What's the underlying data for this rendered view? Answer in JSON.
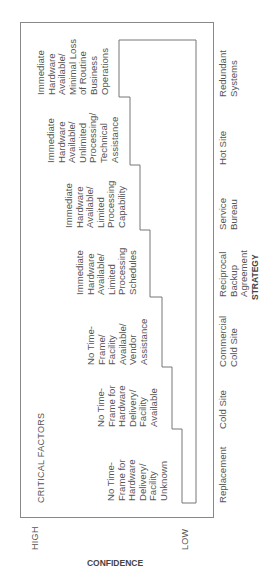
{
  "diagram": {
    "title": "CRITICAL FACTORS",
    "x_axis_label": "STRATEGY",
    "y_axis_label": "CONFIDENCE",
    "y_axis_high": "HIGH",
    "y_axis_low": "LOW",
    "strategies": [
      {
        "label": "Replacement",
        "factor": "No Time-\nFrame for\nHardware\nDelivery/\nFacility\nUnknown"
      },
      {
        "label": "Cold Site",
        "factor": "No Time-\nFrame for\nHardware\nDelivery/\nFacility\nAvailable"
      },
      {
        "label": "Commercial\nCold Site",
        "factor": "No Time-\nFrame/\nFacility\nAvailable/\nVendor\nAssistance"
      },
      {
        "label": "Reciprocal\nBackup\nAgreement",
        "factor": "Immediate\nHardware\nAvailable/\nLimited\nProcessing\nSchedules"
      },
      {
        "label": "Service\nBureau",
        "factor": "Immediate\nHardware\nAvailable/\nLimited\nProcessing\nCapability"
      },
      {
        "label": "Hot Site",
        "factor": "Immediate\nHardware\nAvailable/\nUnlimited\nProcessing/\nTechnical\nAssistance"
      },
      {
        "label": "Redundant\nSystems",
        "factor": "Immediate\nHardware\nAvailable/\nMinimal Loss\nof Routine\nBusiness\nOperations"
      }
    ],
    "line_color": "#777777"
  }
}
